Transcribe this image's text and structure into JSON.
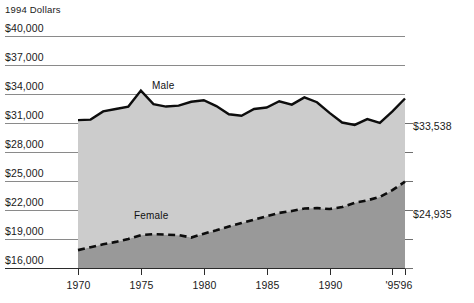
{
  "chart_data": {
    "type": "area",
    "title": "",
    "subtitle": "",
    "unit_note": "1994 Dollars",
    "xlabel": "",
    "ylabel": "",
    "grid": true,
    "legend_position": "inline-annotations",
    "ylim": [
      16000,
      40000
    ],
    "y_ticks": [
      40000,
      37000,
      34000,
      31000,
      28000,
      25000,
      22000,
      19000,
      16000
    ],
    "y_tick_labels": [
      "$40,000",
      "$37,000",
      "$34,000",
      "$31,000",
      "$28,000",
      "$25,000",
      "$22,000",
      "$19,000",
      "$16,000"
    ],
    "xlim": [
      1970,
      1996
    ],
    "x_ticks": [
      1970,
      1975,
      1980,
      1985,
      1990,
      1995,
      1996
    ],
    "x_tick_labels": [
      "1970",
      "1975",
      "1980",
      "1985",
      "1990",
      "'95",
      "'96"
    ],
    "x": [
      1970,
      1971,
      1972,
      1973,
      1974,
      1975,
      1976,
      1977,
      1978,
      1979,
      1980,
      1981,
      1982,
      1983,
      1984,
      1985,
      1986,
      1987,
      1988,
      1989,
      1990,
      1991,
      1992,
      1993,
      1994,
      1995,
      1996
    ],
    "series": [
      {
        "name": "Male",
        "label": "Male",
        "end_value_label": "$33,538",
        "end_value": 33538,
        "style": "solid",
        "values": [
          31300,
          31350,
          32200,
          32450,
          32700,
          34350,
          32950,
          32700,
          32800,
          33200,
          33350,
          32750,
          31900,
          31750,
          32450,
          32600,
          33250,
          32900,
          33650,
          33150,
          32050,
          31050,
          30800,
          31400,
          31000,
          32200,
          33538
        ]
      },
      {
        "name": "Female",
        "label": "Female",
        "end_value_label": "$24,935",
        "end_value": 24935,
        "style": "dashed",
        "values": [
          17850,
          18150,
          18450,
          18700,
          19000,
          19400,
          19500,
          19450,
          19400,
          19150,
          19550,
          19900,
          20300,
          20650,
          21000,
          21350,
          21700,
          21900,
          22150,
          22200,
          22100,
          22300,
          22750,
          23000,
          23350,
          24050,
          24935
        ]
      }
    ],
    "band_colors": {
      "upper": "#cccccc",
      "lower": "#999999",
      "line": "#0d0d0d",
      "gridline": "#8a8a8a"
    }
  }
}
